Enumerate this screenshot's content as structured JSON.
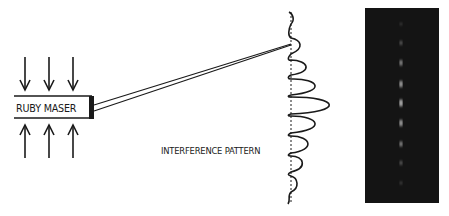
{
  "diagram": {
    "source_label": "RUBY MASER",
    "pattern_label": "INTERFERENCE PATTERN",
    "pump_arrows": {
      "top": {
        "direction": "down",
        "count": 3
      },
      "bottom": {
        "direction": "up",
        "count": 3
      }
    },
    "beams": {
      "count": 2,
      "description": "two beams from maser end converging on screen"
    },
    "intensity_profile": {
      "axis_x": 291,
      "peaks": [
        {
          "y": 17,
          "amplitude": 4
        },
        {
          "y": 44,
          "amplitude": 14
        },
        {
          "y": 66,
          "amplitude": 20
        },
        {
          "y": 85,
          "amplitude": 31
        },
        {
          "y": 105,
          "amplitude": 45
        },
        {
          "y": 124,
          "amplitude": 31
        },
        {
          "y": 144,
          "amplitude": 22
        },
        {
          "y": 163,
          "amplitude": 14
        },
        {
          "y": 183,
          "amplitude": 7
        }
      ]
    },
    "photo_spots_y": [
      43,
      63,
      84,
      103,
      123,
      144,
      163,
      183
    ],
    "colors": {
      "ink": "#1a1a1a",
      "photo_bg": "#141414",
      "spot": "#d8d8d8"
    }
  }
}
